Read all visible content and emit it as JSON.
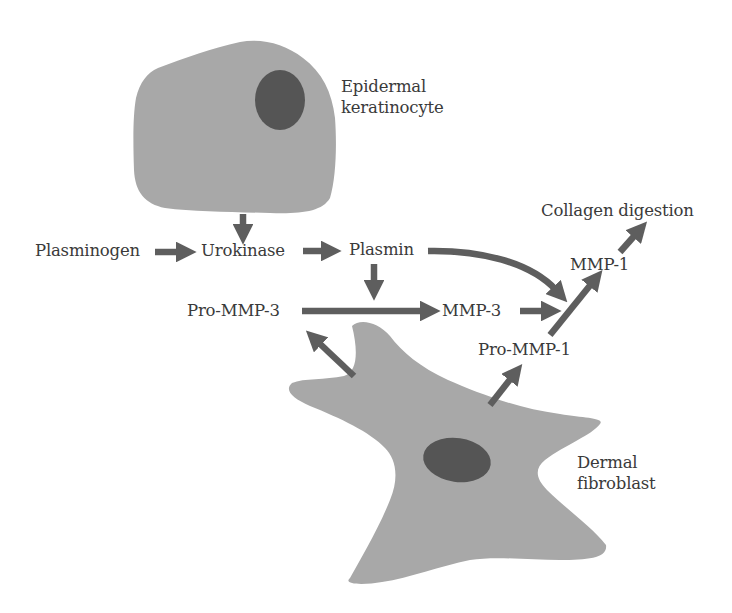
{
  "colors": {
    "cell_fill": "#a8a8a8",
    "nucleus_fill": "#555555",
    "arrow": "#5e5e5e",
    "text": "#3a3a3a",
    "background": "#ffffff"
  },
  "cells": {
    "keratinocyte": {
      "label_line1": "Epidermal",
      "label_line2": "keratinocyte"
    },
    "fibroblast": {
      "label_line1": "Dermal",
      "label_line2": "fibroblast"
    }
  },
  "nodes": {
    "plasminogen": "Plasminogen",
    "urokinase": "Urokinase",
    "plasmin": "Plasmin",
    "pro_mmp3": "Pro-MMP-3",
    "mmp3": "MMP-3",
    "pro_mmp1": "Pro-MMP-1",
    "mmp1": "MMP-1",
    "collagen_digestion": "Collagen digestion"
  },
  "edges": [
    {
      "from": "keratinocyte",
      "to": "urokinase"
    },
    {
      "from": "plasminogen",
      "to": "urokinase"
    },
    {
      "from": "urokinase",
      "to": "plasmin"
    },
    {
      "from": "plasmin",
      "to": "pro_mmp3_to_mmp3"
    },
    {
      "from": "plasmin",
      "to": "pro_mmp1_to_mmp1"
    },
    {
      "from": "pro_mmp3",
      "to": "mmp3"
    },
    {
      "from": "mmp3",
      "to": "pro_mmp1_to_mmp1"
    },
    {
      "from": "pro_mmp1",
      "to": "mmp1"
    },
    {
      "from": "mmp1",
      "to": "collagen_digestion"
    },
    {
      "from": "fibroblast",
      "to": "pro_mmp3"
    },
    {
      "from": "fibroblast",
      "to": "pro_mmp1"
    }
  ]
}
